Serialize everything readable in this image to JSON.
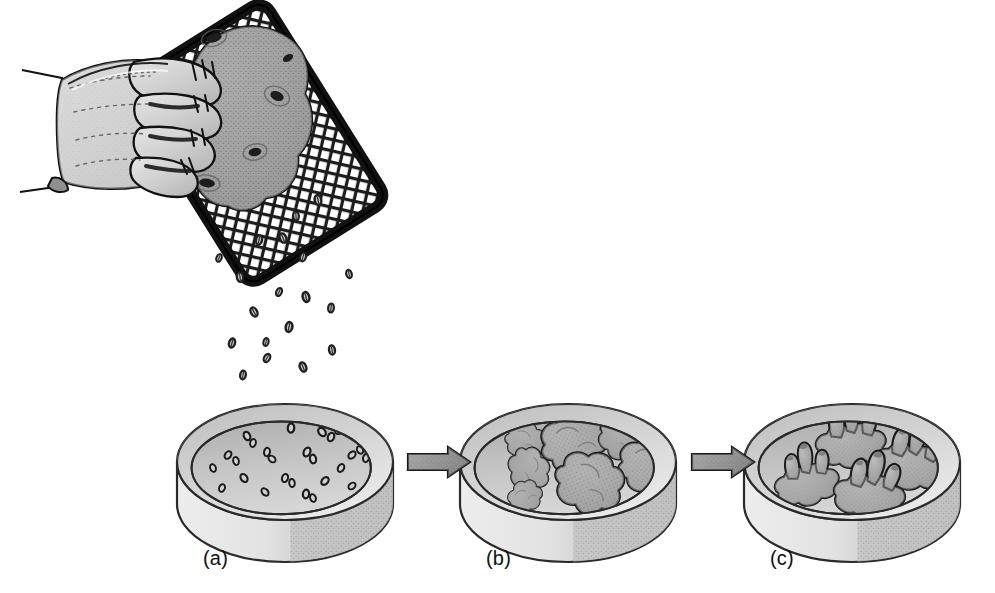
{
  "figure": {
    "background_color": "#ffffff",
    "width": 995,
    "height": 593
  },
  "panels": [
    {
      "id": "a",
      "caption": "(a)",
      "caption_x": 203,
      "caption_y": 547,
      "description": "Petri dish with isolated single plant cells freshly sieved onto the medium",
      "dish": {
        "cx": 285,
        "cy": 462,
        "rx": 108,
        "ry": 58,
        "wall_height": 42
      },
      "content_kind": "single-cells",
      "cells": [
        {
          "x": 247,
          "y": 436,
          "r": 4.4,
          "rot": -25
        },
        {
          "x": 253,
          "y": 443,
          "r": 4.0,
          "rot": 15
        },
        {
          "x": 291,
          "y": 428,
          "r": 4.6,
          "rot": 5
        },
        {
          "x": 322,
          "y": 432,
          "r": 4.6,
          "rot": -40
        },
        {
          "x": 331,
          "y": 437,
          "r": 4.4,
          "rot": 20
        },
        {
          "x": 339,
          "y": 431,
          "r": 4.0,
          "rot": 60
        },
        {
          "x": 228,
          "y": 455,
          "r": 4.2,
          "rot": 35
        },
        {
          "x": 236,
          "y": 461,
          "r": 4.0,
          "rot": -15
        },
        {
          "x": 267,
          "y": 452,
          "r": 4.2,
          "rot": 10
        },
        {
          "x": 272,
          "y": 459,
          "r": 4.0,
          "rot": -50
        },
        {
          "x": 307,
          "y": 452,
          "r": 4.6,
          "rot": 25
        },
        {
          "x": 313,
          "y": 459,
          "r": 4.4,
          "rot": -10
        },
        {
          "x": 352,
          "y": 455,
          "r": 4.2,
          "rot": 45
        },
        {
          "x": 360,
          "y": 450,
          "r": 4.0,
          "rot": -30
        },
        {
          "x": 366,
          "y": 458,
          "r": 4.2,
          "rot": 12
        },
        {
          "x": 213,
          "y": 468,
          "r": 4.0,
          "rot": -20
        },
        {
          "x": 341,
          "y": 468,
          "r": 4.2,
          "rot": 30
        },
        {
          "x": 244,
          "y": 478,
          "r": 4.4,
          "rot": -35
        },
        {
          "x": 285,
          "y": 478,
          "r": 4.2,
          "rot": 18
        },
        {
          "x": 292,
          "y": 483,
          "r": 4.0,
          "rot": -8
        },
        {
          "x": 325,
          "y": 481,
          "r": 4.4,
          "rot": 40
        },
        {
          "x": 222,
          "y": 488,
          "r": 4.0,
          "rot": 22
        },
        {
          "x": 265,
          "y": 492,
          "r": 4.2,
          "rot": -42
        },
        {
          "x": 306,
          "y": 494,
          "r": 4.4,
          "rot": 8
        },
        {
          "x": 313,
          "y": 498,
          "r": 4.0,
          "rot": -18
        },
        {
          "x": 352,
          "y": 486,
          "r": 4.0,
          "rot": 50
        }
      ]
    },
    {
      "id": "b",
      "caption": "(b)",
      "caption_x": 486,
      "caption_y": 547,
      "description": "Petri dish with undifferentiated callus clumps formed by cell division",
      "dish": {
        "cx": 568,
        "cy": 462,
        "rx": 108,
        "ry": 58,
        "wall_height": 42
      },
      "content_kind": "callus-clumps",
      "clumps": [
        {
          "x": 524,
          "y": 440,
          "s": 0.72,
          "rot": 12
        },
        {
          "x": 572,
          "y": 441,
          "s": 1.22,
          "rot": -18
        },
        {
          "x": 621,
          "y": 437,
          "s": 0.86,
          "rot": 40
        },
        {
          "x": 649,
          "y": 463,
          "s": 1.18,
          "rot": -8
        },
        {
          "x": 529,
          "y": 468,
          "s": 0.82,
          "rot": 70
        },
        {
          "x": 588,
          "y": 481,
          "s": 1.26,
          "rot": 22
        },
        {
          "x": 524,
          "y": 497,
          "s": 0.64,
          "rot": -35
        }
      ]
    },
    {
      "id": "c",
      "caption": "(c)",
      "caption_x": 770,
      "caption_y": 547,
      "description": "Petri dish with differentiated plantlets; shoots emerging from callus bases",
      "dish": {
        "cx": 852,
        "cy": 462,
        "rx": 108,
        "ry": 58,
        "wall_height": 42
      },
      "content_kind": "plantlets",
      "plantlets": [
        {
          "x": 850,
          "y": 441,
          "s": 1.06,
          "rot": -6,
          "shoots": 3
        },
        {
          "x": 910,
          "y": 462,
          "s": 1.1,
          "rot": 8,
          "shoots": 3
        },
        {
          "x": 806,
          "y": 481,
          "s": 0.98,
          "rot": -12,
          "shoots": 3
        },
        {
          "x": 869,
          "y": 492,
          "s": 1.08,
          "rot": 5,
          "shoots": 3
        }
      ]
    }
  ],
  "arrows": [
    {
      "id": "arrow-a-to-b",
      "x": 408,
      "y": 462,
      "length": 62,
      "label": ""
    },
    {
      "id": "arrow-b-to-c",
      "x": 692,
      "y": 462,
      "length": 62,
      "label": ""
    }
  ],
  "grater": {
    "label": "sieve-grater",
    "border_color": "#1a1a1a",
    "mesh_color": "#1a1a1a",
    "mesh_fill": "#ffffff",
    "corners": [
      {
        "x": 305,
        "y": 8
      },
      {
        "x": 360,
        "y": 98
      },
      {
        "x": 210,
        "y": 278
      },
      {
        "x": 152,
        "y": 186
      }
    ]
  },
  "hand": {
    "label": "hand-pressing-tuber",
    "skin_fill": "#c9c9c9",
    "skin_light": "#e0e0e0",
    "outline_color": "#111111",
    "sleeve_fill": "#ffffff",
    "fingers": 4
  },
  "tuber": {
    "label": "plant-tuber",
    "fill": "#9a9a9a",
    "outline_color": "#111111",
    "eyes": 5
  },
  "falling_cells": {
    "label": "falling-cells",
    "fill": "#2b2b2b",
    "count": 19,
    "positions": [
      {
        "x": 318,
        "y": 200,
        "r": 5.0,
        "rot": -12
      },
      {
        "x": 259,
        "y": 240,
        "r": 4.6,
        "rot": 10
      },
      {
        "x": 283,
        "y": 238,
        "r": 4.8,
        "rot": -20
      },
      {
        "x": 303,
        "y": 257,
        "r": 4.4,
        "rot": 15
      },
      {
        "x": 240,
        "y": 277,
        "r": 4.8,
        "rot": -8
      },
      {
        "x": 279,
        "y": 292,
        "r": 4.2,
        "rot": 25
      },
      {
        "x": 306,
        "y": 297,
        "r": 5.0,
        "rot": -15
      },
      {
        "x": 331,
        "y": 308,
        "r": 4.4,
        "rot": 5
      },
      {
        "x": 254,
        "y": 312,
        "r": 4.8,
        "rot": -28
      },
      {
        "x": 289,
        "y": 327,
        "r": 5.0,
        "rot": 12
      },
      {
        "x": 232,
        "y": 343,
        "r": 4.6,
        "rot": 18
      },
      {
        "x": 332,
        "y": 350,
        "r": 4.6,
        "rot": -10
      },
      {
        "x": 267,
        "y": 358,
        "r": 4.4,
        "rot": 30
      },
      {
        "x": 303,
        "y": 367,
        "r": 4.8,
        "rot": -22
      },
      {
        "x": 243,
        "y": 375,
        "r": 4.4,
        "rot": 8
      },
      {
        "x": 349,
        "y": 274,
        "r": 4.2,
        "rot": -18
      },
      {
        "x": 219,
        "y": 258,
        "r": 4.0,
        "rot": 22
      },
      {
        "x": 296,
        "y": 216,
        "r": 4.4,
        "rot": -5
      },
      {
        "x": 266,
        "y": 342,
        "r": 4.0,
        "rot": 14
      }
    ]
  },
  "colors": {
    "dish_wall_light": "#e6e6e6",
    "dish_wall_dark": "#bdbdbd",
    "dish_medium_top": "#dcdcdc",
    "dish_medium_back": "#b4b4b4",
    "dish_outline": "#2a2a2a",
    "callus_fill": "#a8a8a8",
    "callus_outline": "#1a1a1a",
    "arrow_fill_light": "#8c8c8c",
    "arrow_fill_dark": "#6e6e6e",
    "arrow_outline": "#1a1a1a",
    "caption_text": "#111111",
    "background": "#ffffff"
  }
}
